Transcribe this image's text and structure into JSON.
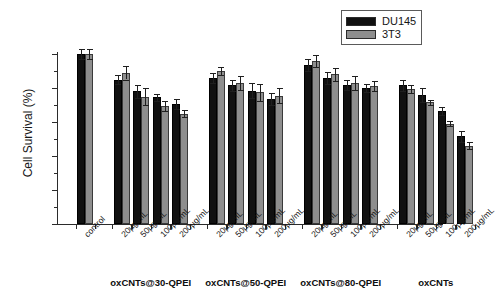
{
  "chart_data": {
    "type": "bar",
    "title": "",
    "xlabel": "",
    "ylabel": "Cell Survival (%)",
    "ylim": [
      0,
      110
    ],
    "yticks": [
      0,
      20,
      40,
      60,
      80,
      100
    ],
    "ytick_labels": [
      "0",
      "20",
      "40",
      "60",
      "80",
      "100"
    ],
    "grid": false,
    "legend_position": "top-right",
    "legend": [
      "DU145",
      "3T3"
    ],
    "series_colors": {
      "DU145": "#111111",
      "3T3": "#8e8e8e"
    },
    "groups": [
      {
        "group_label": "",
        "categories": [
          "control"
        ],
        "series": [
          {
            "name": "DU145",
            "values": [
              100.0
            ],
            "errors": [
              3.0
            ]
          },
          {
            "name": "3T3",
            "values": [
              100.0
            ],
            "errors": [
              3.0
            ]
          }
        ]
      },
      {
        "group_label": "oxCNTs@30-QPEI",
        "categories": [
          "20µg/mL",
          "50µg/mL",
          "100µg/mL",
          "200µg/mL"
        ],
        "series": [
          {
            "name": "DU145",
            "values": [
              85.0,
              78.0,
              74.5,
              70.5
            ],
            "errors": [
              2.5,
              4.0,
              2.0,
              3.0
            ]
          },
          {
            "name": "3T3",
            "values": [
              89.0,
              75.0,
              69.5,
              65.0
            ],
            "errors": [
              4.0,
              5.0,
              3.0,
              2.0
            ]
          }
        ]
      },
      {
        "group_label": "oxCNTs@50-QPEI",
        "categories": [
          "20µg/mL",
          "50µg/mL",
          "100µg/mL",
          "200µg/mL"
        ],
        "series": [
          {
            "name": "DU145",
            "values": [
              86.0,
              81.5,
              78.5,
              73.5
            ],
            "errors": [
              3.0,
              3.5,
              4.5,
              3.5
            ]
          },
          {
            "name": "3T3",
            "values": [
              90.0,
              83.0,
              77.5,
              75.5
            ],
            "errors": [
              2.5,
              4.0,
              5.0,
              4.5
            ]
          }
        ]
      },
      {
        "group_label": "oxCNTs@80-QPEI",
        "categories": [
          "20µg/mL",
          "50µg/mL",
          "100µg/mL",
          "200µg/mL"
        ],
        "series": [
          {
            "name": "DU145",
            "values": [
              93.5,
              86.0,
              82.0,
              80.0
            ],
            "errors": [
              3.5,
              3.5,
              3.0,
              2.5
            ]
          },
          {
            "name": "3T3",
            "values": [
              96.0,
              88.0,
              83.0,
              81.0
            ],
            "errors": [
              3.5,
              4.0,
              4.0,
              3.0
            ]
          }
        ]
      },
      {
        "group_label": "oxCNTs",
        "categories": [
          "20µg/mL",
          "50µg/mL",
          "100µg/mL",
          "200µg/mL"
        ],
        "series": [
          {
            "name": "DU145",
            "values": [
              81.5,
              76.0,
              66.5,
              51.5
            ],
            "errors": [
              3.0,
              4.0,
              2.5,
              3.5
            ]
          },
          {
            "name": "3T3",
            "values": [
              79.5,
              71.5,
              59.0,
              46.0
            ],
            "errors": [
              2.5,
              1.5,
              1.5,
              2.0
            ]
          }
        ]
      }
    ]
  },
  "legend": {
    "items": [
      {
        "label": "DU145",
        "color": "#111111"
      },
      {
        "label": "3T3",
        "color": "#8e8e8e"
      }
    ]
  },
  "axes": {
    "y_title": "Cell Survival (%)"
  }
}
